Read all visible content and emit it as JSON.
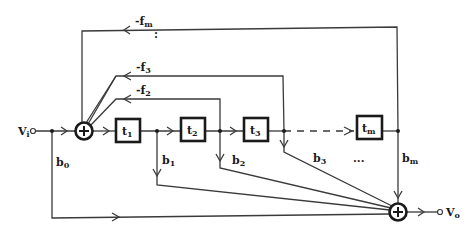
{
  "diagram": {
    "type": "signal-flow block diagram",
    "input": {
      "label": "V",
      "sub": "i"
    },
    "output": {
      "label": "V",
      "sub": "o"
    },
    "delay_blocks": [
      {
        "label": "t",
        "sub": "1"
      },
      {
        "label": "t",
        "sub": "2"
      },
      {
        "label": "t",
        "sub": "3"
      },
      {
        "label": "t",
        "sub": "m"
      }
    ],
    "feedback_gains": [
      {
        "label": "-f",
        "sub": "m"
      },
      {
        "label": "-f",
        "sub": "3"
      },
      {
        "label": "-f",
        "sub": "2"
      }
    ],
    "feedforward_gains": [
      {
        "label": "b",
        "sub": "0"
      },
      {
        "label": "b",
        "sub": "1"
      },
      {
        "label": "b",
        "sub": "2"
      },
      {
        "label": "b",
        "sub": "3"
      },
      {
        "label": "b",
        "sub": "m"
      }
    ],
    "ellipsis_horizontal": "...",
    "ellipsis_vertical": ":",
    "summing_symbol": "+"
  }
}
